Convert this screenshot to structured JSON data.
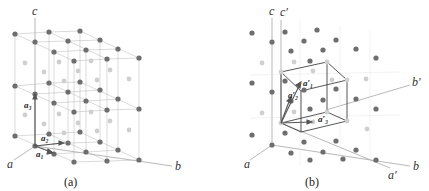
{
  "panel_a": {
    "caption": "(a)",
    "axes": {
      "a": "a",
      "b": "b",
      "c": "c"
    },
    "vectors": {
      "v1": "a₁",
      "v2": "a₂",
      "v3": "a₃"
    }
  },
  "panel_b": {
    "caption": "(b)",
    "axes": {
      "a": "a",
      "b": "b",
      "c": "c",
      "a_prime": "a′",
      "b_prime": "b′",
      "c_prime": "c′"
    },
    "vectors": {
      "v1": "a′₁",
      "v2": "a′₂",
      "v3": "a′₃"
    }
  },
  "colors": {
    "atom_dark": "#6e6e6e",
    "atom_light": "#c8c8c8",
    "line": "#9a9a9a",
    "cell": "#444444"
  }
}
